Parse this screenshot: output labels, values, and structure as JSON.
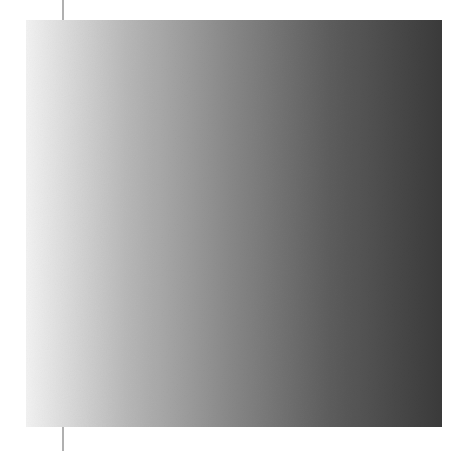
{
  "canvas": {
    "width": 468,
    "height": 451,
    "background": "#ffffff"
  },
  "swatch": {
    "name": "grayscale-gradient-swatch",
    "x": 26,
    "y": 20,
    "width": 416,
    "height": 407,
    "direction": "horizontal-left-to-right",
    "angle_deg": 90,
    "border": "none",
    "texture": "paper-grain-noise",
    "stops": [
      {
        "position_pct": 0,
        "color": "#f2f2f2"
      },
      {
        "position_pct": 24,
        "color": "#b8b8b8"
      },
      {
        "position_pct": 49,
        "color": "#888888"
      },
      {
        "position_pct": 73,
        "color": "#5d5d5d"
      },
      {
        "position_pct": 100,
        "color": "#3a3a3a"
      }
    ],
    "start_color": "#f2f2f2",
    "end_color": "#3a3a3a"
  },
  "rule_line": {
    "name": "vertical-rule-line",
    "x": 62,
    "top": 0,
    "height": 451,
    "thickness_px": 1.5,
    "color": "#b0b0b0",
    "behind_swatch": true
  }
}
